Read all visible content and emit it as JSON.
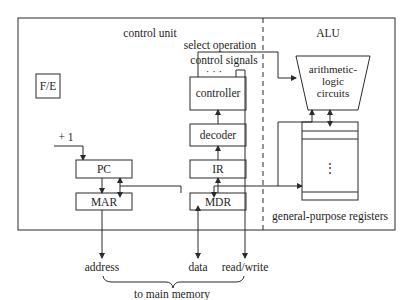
{
  "diagram": {
    "sections": {
      "control_unit": "control unit",
      "alu": "ALU"
    },
    "blocks": {
      "fe": "F/E",
      "pc": "PC",
      "mar": "MAR",
      "controller": "controller",
      "decoder": "decoder",
      "ir": "IR",
      "mdr": "MDR",
      "alu_circuits": [
        "arithmetic-",
        "logic",
        "circuits"
      ],
      "registers": "general-purpose registers",
      "register_dots": "⋮"
    },
    "signals": {
      "increment": "+ 1",
      "select_operation": "select operation",
      "control_signals": "control signals",
      "ellipsis": "· · ·"
    },
    "external": {
      "address": "address",
      "data": "data",
      "read_write": "read/write",
      "to_main_memory": "to main memory"
    }
  }
}
